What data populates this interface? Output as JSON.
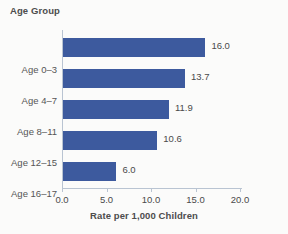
{
  "chart_data": {
    "type": "bar",
    "orientation": "horizontal",
    "title": "",
    "xlabel": "Rate per 1,000 Children",
    "ylabel": "Age Group",
    "categories": [
      "Age 0–3",
      "Age 4–7",
      "Age 8–11",
      "Age 12–15",
      "Age 16–17"
    ],
    "values": [
      16.0,
      13.7,
      11.9,
      10.6,
      6.0
    ],
    "value_labels": [
      "16.0",
      "13.7",
      "11.9",
      "10.6",
      "6.0"
    ],
    "xlim": [
      0.0,
      20.0
    ],
    "xticks": [
      0.0,
      5.0,
      10.0,
      15.0,
      20.0
    ],
    "xtick_labels": [
      "0.0",
      "5.0",
      "10.0",
      "15.0",
      "20.0"
    ],
    "grid": false,
    "legend": null,
    "bar_color": "#3d5a9e",
    "axis_color": "#b9c4d2",
    "text_color": "#4a4a4a",
    "background": "#fbfbfa"
  }
}
